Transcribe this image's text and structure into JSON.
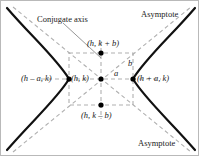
{
  "figure": {
    "type": "diagram",
    "width": 199,
    "height": 156,
    "colors": {
      "curve": "#000000",
      "dashed": "#b0b0b0",
      "text": "#1a1a1a",
      "border": "#b9b9b9",
      "background": "#ffffff",
      "point": "#000000"
    }
  },
  "labels": {
    "conjugate_axis": "Conjugate axis",
    "asymptote_top": "Asymptote",
    "asymptote_bottom": "Asymptote",
    "vertex_left": "(h – a, k)",
    "vertex_right": "(h + a, k)",
    "center": "(h, k)",
    "co_vertex_top": "(h, k + b)",
    "co_vertex_bottom": "(h, k – b)",
    "segment_a": "a",
    "segment_b": "b"
  },
  "geometry": {
    "center": {
      "x": 100,
      "y": 78
    },
    "a": 32,
    "b": 26,
    "rect": {
      "left": 68,
      "right": 132,
      "top": 52,
      "bottom": 104
    },
    "points": [
      {
        "name": "center",
        "x": 100,
        "y": 78
      },
      {
        "name": "vertex-left",
        "x": 68,
        "y": 78
      },
      {
        "name": "vertex-right",
        "x": 132,
        "y": 78
      },
      {
        "name": "co-vertex-top",
        "x": 100,
        "y": 52
      },
      {
        "name": "co-vertex-bottom",
        "x": 100,
        "y": 104
      }
    ]
  }
}
